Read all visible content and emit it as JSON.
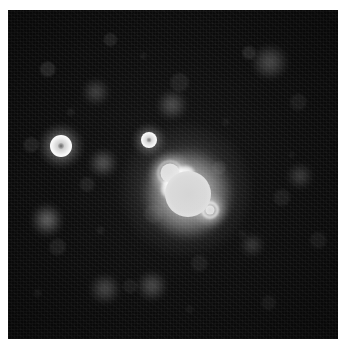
{
  "figure": {
    "kind": "astronomical-image",
    "caption": "",
    "background_color": "#ffffff",
    "field_color": "#0b0b0b",
    "field": {
      "x": 8,
      "y": 10,
      "width": 330,
      "height": 329
    }
  },
  "chart_data": {
    "type": "scatter",
    "title": "",
    "subtitle": "",
    "xlabel": "",
    "ylabel": "",
    "grid": false,
    "legend": "none",
    "axis_visible": false,
    "xlim": [
      0,
      330
    ],
    "ylim": [
      0,
      329
    ],
    "colormap": "grayscale",
    "sources": [
      {
        "id": "main-primary",
        "label": "primary lobe",
        "x": 180,
        "y": 184,
        "radius": 27,
        "peak_level": 255,
        "core_level": 216,
        "saturated": true,
        "morphology": "disc-with-bright-rim"
      },
      {
        "id": "main-companion-nw",
        "label": "north-west companion lobe",
        "x": 162,
        "y": 163,
        "radius": 12,
        "peak_level": 252,
        "core_level": 206,
        "saturated": true,
        "morphology": "disc-with-bright-rim"
      },
      {
        "id": "main-knot-se",
        "label": "south-east knot",
        "x": 202,
        "y": 200,
        "radius": 8,
        "peak_level": 248,
        "core_level": 198,
        "saturated": true,
        "morphology": "compact-knot"
      },
      {
        "id": "star-west",
        "label": "bright ring star (west)",
        "x": 61,
        "y": 146,
        "radius": 11,
        "peak_level": 240,
        "core_level": 120,
        "saturated": true,
        "morphology": "ring"
      },
      {
        "id": "star-north",
        "label": "ring star (north of centre)",
        "x": 149,
        "y": 140,
        "radius": 8,
        "peak_level": 232,
        "core_level": 128,
        "saturated": true,
        "morphology": "ring"
      },
      {
        "id": "blob-sw",
        "label": "faint diffuse source (south-west)",
        "x": 47,
        "y": 220,
        "radius": 11,
        "peak_level": 96,
        "saturated": false,
        "morphology": "diffuse"
      },
      {
        "id": "blob-w",
        "label": "faint diffuse source (west of centre)",
        "x": 103,
        "y": 163,
        "radius": 10,
        "peak_level": 78,
        "saturated": false,
        "morphology": "diffuse"
      },
      {
        "id": "blob-n",
        "label": "faint diffuse source (north)",
        "x": 172,
        "y": 105,
        "radius": 11,
        "peak_level": 72,
        "saturated": false,
        "morphology": "diffuse"
      },
      {
        "id": "blob-ne",
        "label": "faint diffuse source (north-east)",
        "x": 270,
        "y": 62,
        "radius": 13,
        "peak_level": 68,
        "saturated": false,
        "morphology": "diffuse"
      },
      {
        "id": "blob-s1",
        "label": "faint diffuse source (south)",
        "x": 105,
        "y": 289,
        "radius": 12,
        "peak_level": 66,
        "saturated": false,
        "morphology": "diffuse"
      },
      {
        "id": "blob-s2",
        "label": "faint diffuse source (south-centre)",
        "x": 152,
        "y": 286,
        "radius": 11,
        "peak_level": 70,
        "saturated": false,
        "morphology": "diffuse"
      },
      {
        "id": "blob-e",
        "label": "faint diffuse source (east)",
        "x": 300,
        "y": 176,
        "radius": 10,
        "peak_level": 58,
        "saturated": false,
        "morphology": "diffuse"
      },
      {
        "id": "blob-se",
        "label": "faint diffuse source (south-east)",
        "x": 252,
        "y": 245,
        "radius": 9,
        "peak_level": 54,
        "saturated": false,
        "morphology": "diffuse"
      },
      {
        "id": "blob-nw",
        "label": "faint diffuse source (north-west)",
        "x": 96,
        "y": 92,
        "radius": 9,
        "peak_level": 56,
        "saturated": false,
        "morphology": "diffuse"
      }
    ]
  }
}
